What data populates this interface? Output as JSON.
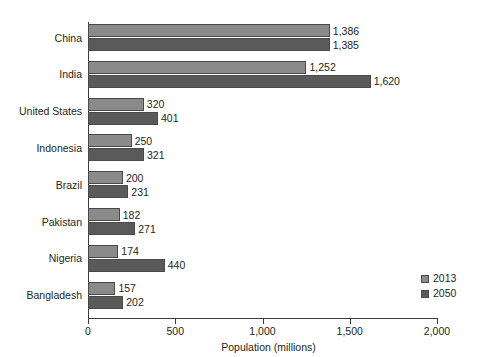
{
  "chart_data": {
    "type": "bar",
    "orientation": "horizontal",
    "title": "",
    "xlabel": "Population (millions)",
    "ylabel": "",
    "xlim": [
      0,
      2000
    ],
    "xticks": [
      "0",
      "500",
      "1,000",
      "1,500",
      "2,000"
    ],
    "xtick_values": [
      0,
      500,
      1000,
      1500,
      2000
    ],
    "grid": false,
    "legend_position": "right-bottom-inside",
    "categories": [
      "China",
      "India",
      "United States",
      "Indonesia",
      "Brazil",
      "Pakistan",
      "Nigeria",
      "Bangladesh"
    ],
    "series": [
      {
        "name": "2013",
        "color": "#8a8a8a",
        "values": [
          1386,
          1252,
          320,
          250,
          200,
          182,
          174,
          157
        ],
        "labels": [
          "1,386",
          "1,252",
          "320",
          "250",
          "200",
          "182",
          "174",
          "157"
        ]
      },
      {
        "name": "2050",
        "color": "#5a5a5a",
        "values": [
          1385,
          1620,
          401,
          321,
          231,
          271,
          440,
          202
        ],
        "labels": [
          "1,385",
          "1,620",
          "401",
          "321",
          "231",
          "271",
          "440",
          "202"
        ]
      }
    ]
  },
  "legend": {
    "entries": [
      {
        "label": "2013",
        "color": "#8a8a8a"
      },
      {
        "label": "2050",
        "color": "#5a5a5a"
      }
    ]
  },
  "axis": {
    "x_title": "Population (millions)"
  },
  "colors": {
    "series_2013": "#8a8a8a",
    "series_2050": "#5a5a5a",
    "axis": "#3b3b3b",
    "text": "#231f20",
    "background": "#ffffff"
  }
}
